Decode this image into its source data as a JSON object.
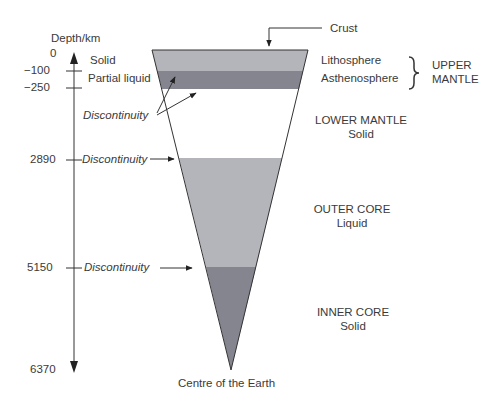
{
  "axis": {
    "title": "Depth/km",
    "ticks": [
      "0",
      "−100",
      "−250",
      "2890",
      "5150",
      "6370"
    ]
  },
  "left_labels": {
    "solid": "Solid",
    "partial_liquid": "Partial liquid",
    "discontinuity_upper": "Discontinuity",
    "discontinuity_2890": "Discontinuity",
    "discontinuity_5150": "Discontinuity"
  },
  "right_labels": {
    "crust": "Crust",
    "lithosphere": "Lithosphere",
    "asthenosphere": "Asthenosphere",
    "upper_mantle_1": "UPPER",
    "upper_mantle_2": "MANTLE",
    "lower_mantle": "LOWER MANTLE",
    "lower_mantle_state": "Solid",
    "outer_core": "OUTER CORE",
    "outer_core_state": "Liquid",
    "inner_core": "INNER CORE",
    "inner_core_state": "Solid",
    "centre": "Centre of the Earth"
  },
  "colors": {
    "lithosphere": "#b4b4bb",
    "asthenosphere": "#858590",
    "lower_mantle": "#ffffff",
    "outer_core": "#b4b4bb",
    "inner_core": "#858590",
    "line": "#333333"
  }
}
